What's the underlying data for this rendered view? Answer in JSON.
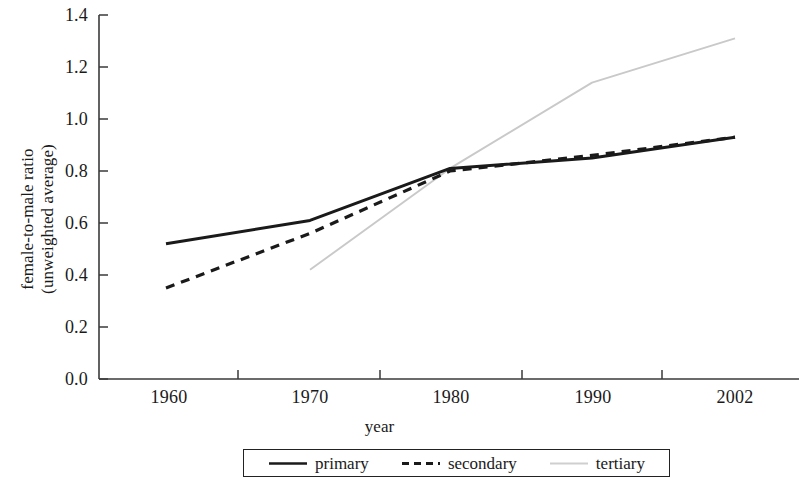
{
  "chart_data": {
    "type": "line",
    "title": "",
    "xlabel": "year",
    "ylabel": "female-to-male ratio (unweighted average)",
    "ylabel_line1": "female-to-male ratio",
    "ylabel_line2": "(unweighted average)",
    "x": [
      1960,
      1970,
      1980,
      1990,
      2002
    ],
    "categories": [
      "1960",
      "1970",
      "1980",
      "1990",
      "2002"
    ],
    "xticklabels": [
      "1960",
      "1970",
      "1980",
      "1990",
      "2002"
    ],
    "yticklabels": [
      "1.4",
      "1.2",
      "1.0",
      "0.8",
      "0.6",
      "0.4",
      "0.2",
      "0.0"
    ],
    "yticks": [
      1.4,
      1.2,
      1.0,
      0.8,
      0.6,
      0.4,
      0.2,
      0.0
    ],
    "ylim": [
      0.0,
      1.4
    ],
    "grid": false,
    "legend_position": "bottom",
    "series": [
      {
        "name": "primary",
        "style": "solid",
        "color": "#1a1a1a",
        "values": [
          0.52,
          0.61,
          0.81,
          0.85,
          0.93
        ]
      },
      {
        "name": "secondary",
        "style": "dashed",
        "color": "#1a1a1a",
        "values": [
          0.35,
          0.56,
          0.8,
          0.86,
          0.93
        ]
      },
      {
        "name": "tertiary",
        "style": "solid",
        "color": "#c9c9c9",
        "values": [
          null,
          0.42,
          0.81,
          1.14,
          1.31
        ]
      }
    ]
  },
  "legend": {
    "items": [
      {
        "label": "primary"
      },
      {
        "label": "secondary"
      },
      {
        "label": "tertiary"
      }
    ]
  },
  "axis": {
    "x_title": "year"
  }
}
